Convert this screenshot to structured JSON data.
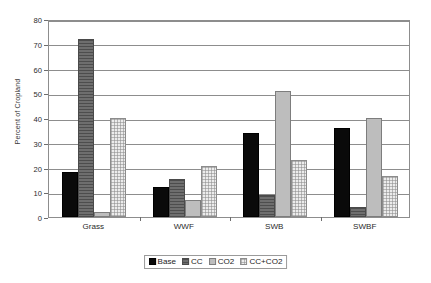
{
  "chart_data": {
    "type": "bar",
    "title": "",
    "subtitle": "",
    "xlabel": "",
    "ylabel": "Percent of Cropland",
    "categories": [
      "Grass",
      "WWF",
      "SWB",
      "SWBF"
    ],
    "series": [
      {
        "name": "Base",
        "values": [
          18,
          12,
          34,
          36
        ]
      },
      {
        "name": "CC",
        "values": [
          72,
          15.5,
          9,
          4
        ]
      },
      {
        "name": "CO2",
        "values": [
          2,
          7,
          51,
          40
        ]
      },
      {
        "name": "CC+CO2",
        "values": [
          40,
          20.5,
          23,
          16.5
        ]
      }
    ],
    "ylim": [
      0,
      80
    ],
    "ytick_step": 10,
    "yticks": [
      0,
      10,
      20,
      30,
      40,
      50,
      60,
      70,
      80
    ],
    "ytick_labels": [
      "0",
      "10",
      "20",
      "30",
      "40",
      "50",
      "60",
      "70",
      "80"
    ],
    "grid": true,
    "grid_axis": "y",
    "legend_position": "bottom-center",
    "series_colors": [
      "#0a0a0a",
      "#6e6e6e",
      "#bdbdbd",
      "#ececec"
    ],
    "series_patterns": [
      "solid",
      "horizontal-lines",
      "solid",
      "checkered"
    ],
    "plot_border_color": "#8d8d8d",
    "axis_text_color": "#2b2b2b",
    "background": "#ffffff"
  }
}
